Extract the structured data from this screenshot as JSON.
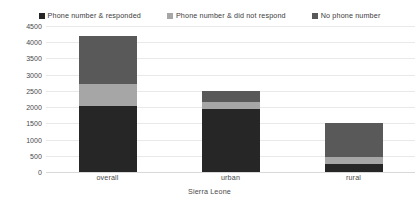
{
  "chart_data": {
    "type": "bar",
    "subtype": "stacked-vertical",
    "title": "",
    "xlabel": "Sierra Leone",
    "ylabel": "",
    "categories": [
      "overall",
      "urban",
      "rural"
    ],
    "series": [
      {
        "name": "Phone number & responded",
        "color": "#262626",
        "values": [
          2050,
          1950,
          250
        ]
      },
      {
        "name": "Phone number & did not respond",
        "color": "#a6a6a6",
        "values": [
          650,
          200,
          200
        ]
      },
      {
        "name": "No phone number",
        "color": "#595959",
        "values": [
          1500,
          350,
          1050
        ]
      }
    ],
    "totals": [
      4200,
      2500,
      1500
    ],
    "ylim": [
      0,
      4500
    ],
    "yticks": [
      0,
      500,
      1000,
      1500,
      2000,
      2500,
      3000,
      3500,
      4000,
      4500
    ],
    "ytick_labels": [
      "0",
      "500",
      "1000",
      "1500",
      "2000",
      "2500",
      "3000",
      "3500",
      "4000",
      "4500"
    ],
    "grid": true,
    "grid_color": "#e9e9e9",
    "legend_position": "top",
    "legend": [
      {
        "label": "Phone number & responded",
        "color": "#262626",
        "swatch": "legend-swatch-responded"
      },
      {
        "label": "Phone number & did not respond",
        "color": "#a6a6a6",
        "swatch": "legend-swatch-no-response"
      },
      {
        "label": "No phone number",
        "color": "#595959",
        "swatch": "legend-swatch-no-phone"
      }
    ],
    "background": "#ffffff",
    "axis_text_color": "#4a4a4a"
  }
}
